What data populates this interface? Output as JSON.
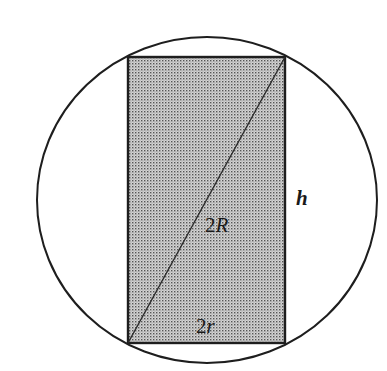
{
  "diagram": {
    "type": "geometry",
    "description_shapes": [
      "circle",
      "rectangle",
      "diagonal"
    ],
    "colors": {
      "stroke": "#1e1e1e",
      "fill_dot": "#5a5a5a",
      "fill_bg": "#d2d2d2",
      "background": "#ffffff"
    },
    "circle": {
      "cx": 207,
      "cy": 200,
      "rx": 170,
      "ry": 163
    },
    "rectangle": {
      "x": 128,
      "y": 57,
      "width": 157,
      "height": 286
    },
    "diagonal": {
      "x1": 128,
      "y1": 343,
      "x2": 285,
      "y2": 57
    },
    "labels": {
      "diagonal": {
        "number": "2",
        "variable": "R"
      },
      "height": {
        "variable": "h"
      },
      "base": {
        "number": "2",
        "variable": "r"
      }
    }
  }
}
